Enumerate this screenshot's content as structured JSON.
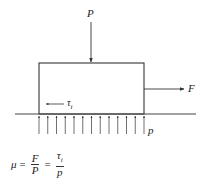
{
  "diagram": {
    "type": "free-body friction diagram",
    "colors": {
      "line": "#333333",
      "text": "#222222",
      "background": "#ffffff"
    },
    "labels": {
      "normal_force": "P",
      "applied_force": "F",
      "shear_stress": "τ",
      "shear_stress_sub": "i",
      "pressure": "p"
    },
    "pressure_arrow_count": 13,
    "formula": {
      "lhs": "μ",
      "eq1": "=",
      "frac1_num": "F",
      "frac1_den": "P",
      "eq2": "=",
      "frac2_num": "τ",
      "frac2_num_sub": "i",
      "frac2_den": "p"
    }
  }
}
